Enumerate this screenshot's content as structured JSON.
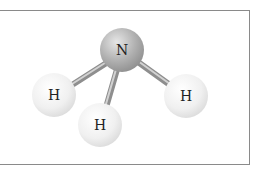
{
  "diagram": {
    "title": "",
    "molecule": "NH3",
    "atoms": [
      {
        "id": "n",
        "label": "N",
        "cx": 122,
        "cy": 50,
        "r": 22,
        "color": "#a8a8a8"
      },
      {
        "id": "h1",
        "label": "H",
        "cx": 54,
        "cy": 95,
        "r": 22,
        "color": "#ececec"
      },
      {
        "id": "h2",
        "label": "H",
        "cx": 100,
        "cy": 125,
        "r": 22,
        "color": "#ececec"
      },
      {
        "id": "h3",
        "label": "H",
        "cx": 186,
        "cy": 96,
        "r": 22,
        "color": "#ececec"
      }
    ],
    "bonds": [
      {
        "from": "n",
        "to": "h1"
      },
      {
        "from": "n",
        "to": "h2"
      },
      {
        "from": "n",
        "to": "h3"
      }
    ]
  }
}
